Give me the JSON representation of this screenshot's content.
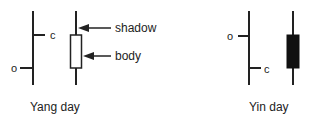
{
  "diagram": {
    "yang": {
      "caption": "Yang day",
      "open_label": "o",
      "close_label": "c",
      "candle_body_fill": "#ffffff"
    },
    "yin": {
      "caption": "Yin day",
      "open_label": "o",
      "close_label": "c",
      "candle_body_fill": "#111111"
    },
    "annotations": {
      "shadow_label": "shadow",
      "body_label": "body"
    },
    "colors": {
      "stroke": "#222222",
      "background": "#ffffff"
    }
  }
}
